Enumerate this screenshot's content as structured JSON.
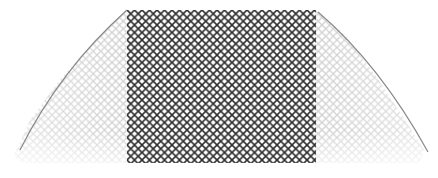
{
  "figure": {
    "description": "Trapezoidal lattice mesh with dark central panel and faded side wings",
    "canvas": {
      "width": 438,
      "height": 178,
      "background": "#ffffff"
    },
    "colors": {
      "dark_mesh": "#2e2e2e",
      "light_mesh": "#cfcfcf",
      "edge_line": "#8a8a8a"
    },
    "mesh": {
      "pitch": 7.5,
      "dark_stroke": 1.6,
      "light_stroke": 1.3
    },
    "panels": {
      "left_wing": {
        "points": "14,156 30,120 60,80 95,40 127,10 127,163 60,163 20,162"
      },
      "center": {
        "points": "127,10 316,10 316,163 127,163"
      },
      "right_wing": {
        "points": "316,10 345,35 375,75 405,120 425,152 418,163 316,163"
      }
    },
    "edges": {
      "left": "M 20 150 Q 60 70 127 10",
      "right": "M 318 12 Q 380 65 428 152"
    }
  }
}
